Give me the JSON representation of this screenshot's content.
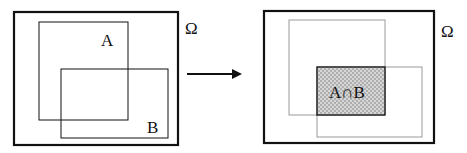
{
  "left_diagram": {
    "universe_label": "Ω",
    "set_a_label": "A",
    "set_b_label": "B"
  },
  "right_diagram": {
    "universe_label": "Ω",
    "intersection_label": "A∩B"
  },
  "arrow": {
    "direction": "right"
  },
  "colors": {
    "stroke": "#111111",
    "faint_stroke": "#9a9a9a",
    "hatch": "#bdbdbd"
  }
}
